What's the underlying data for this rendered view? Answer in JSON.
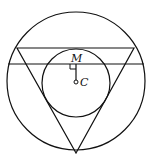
{
  "diagram": {
    "labels": {
      "m": "M",
      "c": "C"
    },
    "colors": {
      "stroke": "#111111",
      "background": "#ffffff"
    },
    "outer_circle": {
      "cx": 76,
      "cy": 81,
      "r": 69
    },
    "inner_circle": {
      "cx": 76,
      "cy": 83,
      "r": 34
    },
    "triangle": {
      "points": "17,48 134,48 76,153"
    },
    "chord": {
      "x1": 8,
      "y1": 64,
      "x2": 144,
      "y2": 64
    },
    "segment_MC": {
      "x1": 76,
      "y1": 64,
      "x2": 76,
      "y2": 81
    },
    "point_C": {
      "cx": 76,
      "cy": 82,
      "r": 2
    }
  }
}
